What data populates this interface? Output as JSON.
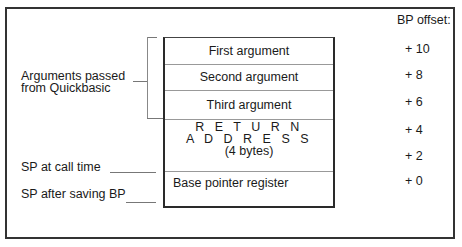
{
  "header": {
    "offset_title": "BP offset:"
  },
  "stack": {
    "rows": [
      {
        "label": "First argument",
        "offset": "+ 10"
      },
      {
        "label": "Second argument",
        "offset": "+ 8"
      },
      {
        "label": "Third argument",
        "offset": "+ 6"
      },
      {
        "label_lines": [
          "R E T U R N",
          "A D D R E S S",
          "(4 bytes)"
        ],
        "offsets": [
          "+ 4",
          "+ 2"
        ]
      },
      {
        "label": "Base pointer register",
        "offset": "+ 0"
      }
    ]
  },
  "annotations": {
    "arguments_line1": "Arguments passed",
    "arguments_line2": "from Quickbasic",
    "sp_call": "SP at call time",
    "sp_after": "SP after saving BP"
  }
}
